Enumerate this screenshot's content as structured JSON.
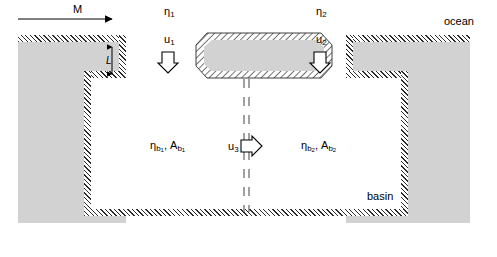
{
  "figure": {
    "type": "schematic-diagram",
    "canvas": {
      "width": 497,
      "height": 257
    },
    "colors": {
      "land_fill": "#d2d2d2",
      "water_fill": "#ffffff",
      "hatch_line": "#2b2b2b",
      "ink": "#000000",
      "page": "#ffffff"
    }
  },
  "labels": {
    "forcing": {
      "symbol": "M",
      "x": 77,
      "y": 8
    },
    "ocean": {
      "text": "ocean",
      "x": 448,
      "y": 20
    },
    "basin": {
      "text": "basin",
      "x": 384,
      "y": 196
    },
    "channel_width": {
      "symbol": "L",
      "x": 109,
      "y": 59
    },
    "inlet1": {
      "elevation": "η",
      "elevation_sub": "1",
      "velocity": "u",
      "velocity_sub": "1",
      "eta_x": 168,
      "eta_y": 8,
      "u_x": 168,
      "u_y": 40
    },
    "inlet2": {
      "elevation": "η",
      "elevation_sub": "2",
      "velocity": "u",
      "velocity_sub": "2",
      "eta_x": 320,
      "eta_y": 8,
      "u_x": 320,
      "u_y": 40
    },
    "basin1": {
      "elevation": "η",
      "elevation_sub": "b",
      "elevation_sub2": "1",
      "area": "A",
      "area_sub": "b",
      "area_sub2": "1",
      "x": 156,
      "y": 140
    },
    "basin2": {
      "elevation": "η",
      "elevation_sub": "b",
      "elevation_sub2": "2",
      "area": "A",
      "area_sub": "b",
      "area_sub2": "2",
      "x": 305,
      "y": 140
    },
    "exchange": {
      "velocity": "u",
      "velocity_sub": "3",
      "x": 234,
      "y": 141
    }
  },
  "geometry": {
    "left_land": {
      "x": 18,
      "y": 35,
      "w": 112,
      "h": 188
    },
    "right_land": {
      "x": 346,
      "y": 35,
      "w": 124,
      "h": 188
    },
    "island": {
      "x": 196,
      "y": 33,
      "w": 136,
      "h": 44
    },
    "basin_water": {
      "x": 90,
      "y": 77,
      "w": 318,
      "h": 136
    },
    "divider_x": 246,
    "divider_top": 80,
    "divider_bottom": 212
  },
  "annotations": {
    "arrow_forcing": {
      "from_x": 18,
      "to_x": 118,
      "y": 19
    },
    "arrow_inlet1": {
      "x": 168,
      "y": 52,
      "direction": "down"
    },
    "arrow_inlet2": {
      "x": 320,
      "y": 52,
      "direction": "down"
    },
    "arrow_exchange": {
      "x": 252,
      "y": 146,
      "direction": "right"
    },
    "dim_arrow_L": {
      "x": 112,
      "top_y": 45,
      "bottom_y": 76
    }
  }
}
